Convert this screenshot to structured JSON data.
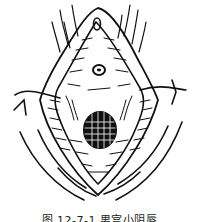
{
  "figure": {
    "caption": "图 12-7-1  男宫小阴唇",
    "stroke_color": "#111111",
    "background": "#ffffff",
    "parts": [
      {
        "id": "clitoris-hood",
        "label": "clitoral hood"
      },
      {
        "id": "urethral-opening",
        "label": "urethral opening"
      },
      {
        "id": "vaginal-opening",
        "label": "vaginal opening (hatched)"
      },
      {
        "id": "labia-minora",
        "label": "labia minora"
      },
      {
        "id": "labia-majora",
        "label": "labia majora"
      },
      {
        "id": "pubic-hair",
        "label": "hair strokes"
      }
    ]
  }
}
